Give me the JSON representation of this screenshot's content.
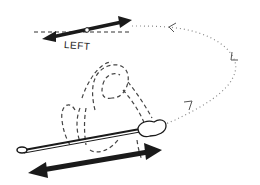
{
  "diagram": {
    "labels": {
      "direction": "LEFT"
    },
    "colors": {
      "ink": "#1a1a1a",
      "dotted_path": "#888888",
      "background": "#ffffff"
    },
    "elements": [
      "top-double-arrow",
      "dashed-reference-line",
      "pivot-point",
      "dotted-loop-path",
      "path-direction-arrowheads",
      "dashed-figure-outline",
      "rod",
      "hand-grip",
      "rod-loop-end",
      "bottom-double-arrow"
    ]
  }
}
